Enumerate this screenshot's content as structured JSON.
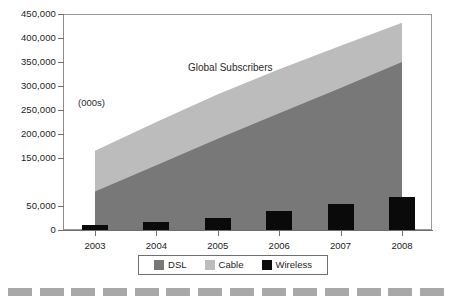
{
  "chart_data": {
    "type": "area",
    "title": "Global Subscribers",
    "annotation": "(000s)",
    "xlabel": "",
    "ylabel": "",
    "categories": [
      "2003",
      "2004",
      "2005",
      "2006",
      "2007",
      "2008"
    ],
    "x": [
      2003,
      2004,
      2005,
      2006,
      2007,
      2008
    ],
    "ylim": [
      0,
      450000
    ],
    "xlim": [
      2003,
      2008
    ],
    "grid": false,
    "legend_position": "bottom",
    "y_tick_labels": [
      "450,000",
      "400,000",
      "350,000",
      "300,000",
      "250,000",
      "200,000",
      "150,000",
      "50,000",
      "0"
    ],
    "y_tick_values": [
      450000,
      400000,
      350000,
      300000,
      250000,
      200000,
      150000,
      50000,
      0
    ],
    "series": [
      {
        "name": "DSL",
        "color": "#787878",
        "render": "area-stacked",
        "values": [
          80000,
          135000,
          190000,
          243000,
          296000,
          350000
        ]
      },
      {
        "name": "Cable",
        "color": "#bcbcbc",
        "render": "area-stacked",
        "values": [
          85000,
          90000,
          93000,
          92000,
          88000,
          82000
        ]
      },
      {
        "name": "Wireless",
        "color": "#0a0a0a",
        "render": "bar",
        "values": [
          10000,
          16000,
          26000,
          39000,
          54000,
          68000
        ]
      }
    ],
    "stacked_tops": {
      "dsl": [
        80000,
        135000,
        190000,
        243000,
        296000,
        350000
      ],
      "cable": [
        165000,
        225000,
        283000,
        335000,
        384000,
        432000
      ]
    },
    "legend": [
      {
        "label": "DSL",
        "color": "#787878"
      },
      {
        "label": "Cable",
        "color": "#bcbcbc"
      },
      {
        "label": "Wireless",
        "color": "#0a0a0a"
      }
    ]
  },
  "decoration": {
    "dash_count": 14,
    "dash_color": "#a8a8a8"
  }
}
